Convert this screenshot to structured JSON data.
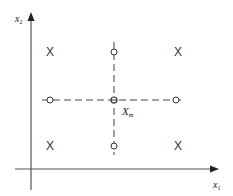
{
  "diagram": {
    "type": "design-of-experiments-grid",
    "axes": {
      "x": {
        "label": "x",
        "subscript": "1"
      },
      "y": {
        "label": "x",
        "subscript": "2"
      }
    },
    "center_point": {
      "label": "X",
      "subscript": "m"
    },
    "factorial_points_marker": "X",
    "factorial_points": [
      {
        "id": "top-left",
        "x": 50,
        "y": 52
      },
      {
        "id": "top-right",
        "x": 178,
        "y": 52
      },
      {
        "id": "bottom-left",
        "x": 50,
        "y": 146
      },
      {
        "id": "bottom-right",
        "x": 178,
        "y": 146
      }
    ],
    "axial_points": [
      {
        "id": "top",
        "x": 114,
        "y": 52
      },
      {
        "id": "left",
        "x": 50,
        "y": 100
      },
      {
        "id": "right",
        "x": 176,
        "y": 100
      },
      {
        "id": "bottom",
        "x": 114,
        "y": 146
      }
    ],
    "center": {
      "x": 114,
      "y": 100
    },
    "colors": {
      "line": "#333333",
      "background": "#ffffff"
    }
  }
}
